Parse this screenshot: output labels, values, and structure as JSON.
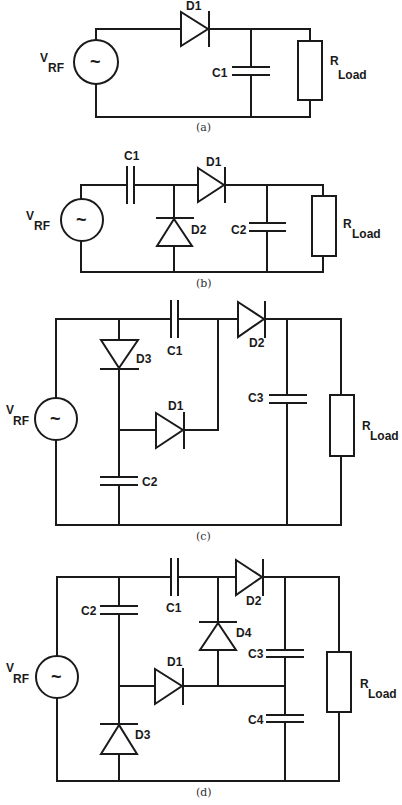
{
  "figure": {
    "background": "#ffffff",
    "line_color": "#1a1a1a",
    "panels": [
      {
        "id": "a",
        "caption": "(a)",
        "source": {
          "label_main": "V",
          "label_sub": "RF",
          "symbol": "~"
        },
        "components": {
          "D1": "D1",
          "C1": "C1",
          "load_main": "R",
          "load_sub": "Load"
        }
      },
      {
        "id": "b",
        "caption": "(b)",
        "source": {
          "label_main": "V",
          "label_sub": "RF",
          "symbol": "~"
        },
        "components": {
          "C1": "C1",
          "D1": "D1",
          "D2": "D2",
          "C2": "C2",
          "load_main": "R",
          "load_sub": "Load"
        }
      },
      {
        "id": "c",
        "caption": "(c)",
        "source": {
          "label_main": "V",
          "label_sub": "RF",
          "symbol": "~"
        },
        "components": {
          "C1": "C1",
          "C2": "C2",
          "C3": "C3",
          "D1": "D1",
          "D2": "D2",
          "D3": "D3",
          "load_main": "R",
          "load_sub": "Load"
        }
      },
      {
        "id": "d",
        "caption": "(d)",
        "source": {
          "label_main": "V",
          "label_sub": "RF",
          "symbol": "~"
        },
        "components": {
          "C1": "C1",
          "C2": "C2",
          "C3": "C3",
          "C4": "C4",
          "D1": "D1",
          "D2": "D2",
          "D3": "D3",
          "D4": "D4",
          "load_main": "R",
          "load_sub": "Load"
        }
      }
    ]
  }
}
